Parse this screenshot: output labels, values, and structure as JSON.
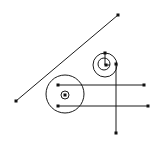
{
  "canvas": {
    "width": 163,
    "height": 142,
    "background": "#ffffff"
  },
  "style": {
    "stroke": "#1a1a1a",
    "stroke_width": 1,
    "dot_size": 3,
    "dot_color": "#111111"
  },
  "lines": [
    {
      "id": "diagonal-line",
      "x1": 16,
      "y1": 101,
      "x2": 118,
      "y2": 15
    },
    {
      "id": "horizontal-line-upper",
      "x1": 58,
      "y1": 85,
      "x2": 144,
      "y2": 85
    },
    {
      "id": "horizontal-line-lower",
      "x1": 58,
      "y1": 106,
      "x2": 148,
      "y2": 106
    },
    {
      "id": "vertical-line",
      "x1": 116,
      "y1": 64,
      "x2": 116,
      "y2": 133
    },
    {
      "id": "small-radius-vertical-tick",
      "x1": 105,
      "y1": 53,
      "x2": 105,
      "y2": 65
    },
    {
      "id": "small-radius-horizontal-tick",
      "x1": 105,
      "y1": 65,
      "x2": 110,
      "y2": 65
    }
  ],
  "circles": [
    {
      "id": "large-circle",
      "cx": 65,
      "cy": 94,
      "r": 19
    },
    {
      "id": "large-inner-circle",
      "cx": 65,
      "cy": 95,
      "r": 4
    },
    {
      "id": "small-outer-circle",
      "cx": 105,
      "cy": 65,
      "r": 12
    },
    {
      "id": "small-inner-circle",
      "cx": 104,
      "cy": 64,
      "r": 6
    }
  ],
  "points": [
    {
      "id": "diagonal-start-dot",
      "x": 16,
      "y": 101
    },
    {
      "id": "diagonal-end-dot",
      "x": 118,
      "y": 15
    },
    {
      "id": "upper-line-start-dot",
      "x": 58,
      "y": 85
    },
    {
      "id": "upper-line-end-dot",
      "x": 144,
      "y": 85
    },
    {
      "id": "lower-line-start-dot",
      "x": 58,
      "y": 106
    },
    {
      "id": "lower-line-end-dot",
      "x": 148,
      "y": 106
    },
    {
      "id": "vertical-line-top-dot",
      "x": 116,
      "y": 64
    },
    {
      "id": "vertical-line-bottom-dot",
      "x": 116,
      "y": 133
    },
    {
      "id": "small-circle-top-dot",
      "x": 105,
      "y": 53
    },
    {
      "id": "small-circle-center-dot",
      "x": 106,
      "y": 65
    },
    {
      "id": "large-inner-center-dot",
      "x": 65,
      "y": 95
    }
  ]
}
